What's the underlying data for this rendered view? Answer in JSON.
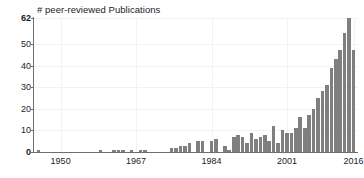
{
  "chart_data": {
    "type": "bar",
    "title": "# peer-reviewed Publications",
    "xlabel": "",
    "ylabel": "",
    "ylim": [
      0,
      62
    ],
    "xlim": [
      1944,
      2017
    ],
    "grid": true,
    "legend": null,
    "bar_color": "#7f7f7f",
    "axis_color": "#6e6e6e",
    "gridline_color": "#f2f2f2",
    "y_ticks": [
      {
        "value": 62,
        "label": "62",
        "emphasis": true
      },
      {
        "value": 50,
        "label": "50",
        "emphasis": false
      },
      {
        "value": 40,
        "label": "40",
        "emphasis": false
      },
      {
        "value": 30,
        "label": "30",
        "emphasis": false
      },
      {
        "value": 20,
        "label": "20",
        "emphasis": false
      },
      {
        "value": 10,
        "label": "10",
        "emphasis": false
      },
      {
        "value": 0,
        "label": "0",
        "emphasis": true
      }
    ],
    "x_ticks": [
      {
        "value": 1950,
        "label": "1950"
      },
      {
        "value": 1967,
        "label": "1967"
      },
      {
        "value": 1984,
        "label": "1984"
      },
      {
        "value": 2001,
        "label": "2001"
      },
      {
        "value": 2016,
        "label": "2016"
      }
    ],
    "categories": [
      1945,
      1946,
      1947,
      1948,
      1949,
      1950,
      1951,
      1952,
      1953,
      1954,
      1955,
      1956,
      1957,
      1958,
      1959,
      1960,
      1961,
      1962,
      1963,
      1964,
      1965,
      1966,
      1967,
      1968,
      1969,
      1970,
      1971,
      1972,
      1973,
      1974,
      1975,
      1976,
      1977,
      1978,
      1979,
      1980,
      1981,
      1982,
      1983,
      1984,
      1985,
      1986,
      1987,
      1988,
      1989,
      1990,
      1991,
      1992,
      1993,
      1994,
      1995,
      1996,
      1997,
      1998,
      1999,
      2000,
      2001,
      2002,
      2003,
      2004,
      2005,
      2006,
      2007,
      2008,
      2009,
      2010,
      2011,
      2012,
      2013,
      2014,
      2015,
      2016
    ],
    "values": [
      1,
      0,
      0,
      0,
      0,
      0,
      0,
      0,
      0,
      0,
      0,
      0,
      0,
      0,
      1,
      0,
      0,
      1,
      1,
      1,
      0,
      1,
      0,
      1,
      1,
      0,
      0,
      0,
      0,
      0,
      2,
      2,
      3,
      3,
      4,
      0,
      5,
      5,
      0,
      5,
      6,
      0,
      3,
      1,
      7,
      8,
      7,
      4,
      9,
      6,
      7,
      8,
      5,
      12,
      4,
      10,
      9,
      9,
      11,
      16,
      11,
      17,
      20,
      25,
      28,
      31,
      39,
      43,
      47,
      55,
      62,
      47
    ]
  }
}
